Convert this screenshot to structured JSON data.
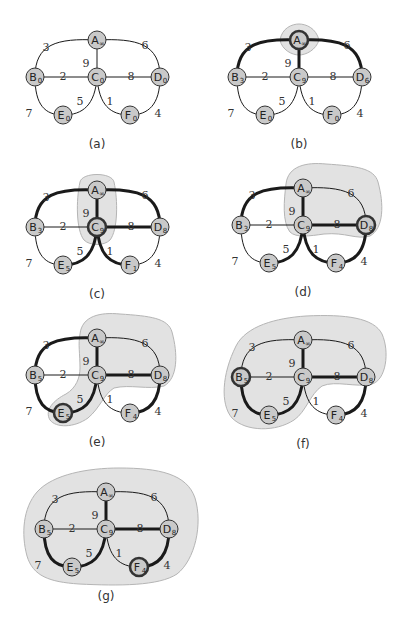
{
  "figure": {
    "node_fill": "#c9c9c9",
    "region_fill": "#e2e2e2",
    "edge_color": "#1a1a1a"
  },
  "graph": {
    "nodes": [
      {
        "id": "A",
        "x": 97,
        "y": 40
      },
      {
        "id": "B",
        "x": 35,
        "y": 77
      },
      {
        "id": "C",
        "x": 97,
        "y": 77
      },
      {
        "id": "D",
        "x": 160,
        "y": 77
      },
      {
        "id": "E",
        "x": 63,
        "y": 115
      },
      {
        "id": "F",
        "x": 130,
        "y": 115
      }
    ],
    "edges": [
      {
        "id": "AB",
        "from": "A",
        "to": "B",
        "weight": "3",
        "label_x": 46,
        "label_y": 47
      },
      {
        "id": "AD",
        "from": "A",
        "to": "D",
        "weight": "6",
        "label_x": 145,
        "label_y": 45
      },
      {
        "id": "AC",
        "from": "A",
        "to": "C",
        "weight": "9",
        "label_x": 86,
        "label_y": 63
      },
      {
        "id": "BC",
        "from": "B",
        "to": "C",
        "weight": "2",
        "label_x": 63,
        "label_y": 76
      },
      {
        "id": "CD",
        "from": "C",
        "to": "D",
        "weight": "8",
        "label_x": 131,
        "label_y": 76
      },
      {
        "id": "CE",
        "from": "C",
        "to": "E",
        "weight": "5",
        "label_x": 80,
        "label_y": 101
      },
      {
        "id": "CF",
        "from": "C",
        "to": "F",
        "weight": "1",
        "label_x": 110,
        "label_y": 101
      },
      {
        "id": "BE",
        "from": "B",
        "to": "E",
        "weight": "7",
        "label_x": 29,
        "label_y": 113
      },
      {
        "id": "DF",
        "from": "D",
        "to": "F",
        "weight": "4",
        "label_x": 158,
        "label_y": 113
      }
    ]
  },
  "panels": [
    {
      "label": "(a)",
      "ox": 0,
      "oy": 0,
      "values": {
        "A": "∞",
        "B": "0",
        "C": "0",
        "D": "0",
        "E": "0",
        "F": "0"
      },
      "thick_edges": [],
      "thick_nodes": [],
      "region": ""
    },
    {
      "label": "(b)",
      "ox": 202,
      "oy": 0,
      "values": {
        "A": "∞",
        "B": "3",
        "C": "9",
        "D": "6",
        "E": "0",
        "F": "0"
      },
      "thick_edges": [
        "AB",
        "AC",
        "AD"
      ],
      "thick_nodes": [
        "A"
      ],
      "region": "M78,40 C80,28 90,24 97,24 C104,24 114,28 117,40 C114,50 104,55 97,55 C90,55 80,50 78,40 Z"
    },
    {
      "label": "(c)",
      "ox": 0,
      "oy": 150,
      "values": {
        "A": "∞",
        "B": "3",
        "C": "9",
        "D": "8",
        "E": "5",
        "F": "1"
      },
      "thick_edges": [
        "AB",
        "AC",
        "AD",
        "CD",
        "CE",
        "CF"
      ],
      "thick_nodes": [
        "C"
      ],
      "region": "M80,32 C82,22 112,22 114,32 C118,50 118,80 110,90 C104,96 90,96 84,90 C76,80 76,50 80,32 Z"
    },
    {
      "label": "(d)",
      "ox": 206,
      "oy": 148,
      "values": {
        "A": "∞",
        "B": "3",
        "C": "9",
        "D": "8",
        "E": "5",
        "F": "4"
      },
      "thick_edges": [
        "AB",
        "AC",
        "CD",
        "CE",
        "CF",
        "DF"
      ],
      "thick_nodes": [
        "D"
      ],
      "region": "M80,36 C82,18 100,14 120,16 C150,18 168,20 172,34 C178,56 178,80 164,88 C150,92 140,84 118,86 C104,88 90,90 84,84 C76,74 78,52 80,36 Z"
    },
    {
      "label": "(e)",
      "ox": 0,
      "oy": 298,
      "values": {
        "A": "∞",
        "B": "5",
        "C": "9",
        "D": "8",
        "E": "5",
        "F": "4"
      },
      "thick_edges": [
        "AB",
        "AC",
        "CD",
        "CE",
        "BE",
        "DF"
      ],
      "thick_nodes": [
        "E"
      ],
      "region": "M80,36 C82,18 100,14 120,16 C150,18 168,20 172,34 C178,56 178,80 164,88 C148,92 130,86 114,90 C104,96 100,110 88,120 C74,130 56,130 50,122 C44,112 54,102 66,96 C76,90 80,80 80,70 C80,56 78,46 80,36 Z"
    },
    {
      "label": "(f)",
      "ox": 206,
      "oy": 300,
      "values": {
        "A": "∞",
        "B": "5",
        "C": "9",
        "D": "8",
        "E": "5",
        "F": "4"
      },
      "thick_edges": [
        "AC",
        "CD",
        "CE",
        "BE",
        "DF"
      ],
      "thick_nodes": [
        "B"
      ],
      "region": "M30,46 C40,26 70,18 100,16 C140,14 168,18 176,34 C184,52 180,80 166,84 C150,88 130,80 116,86 C104,94 100,112 88,120 C70,132 40,132 26,118 C14,104 16,74 30,46 Z"
    },
    {
      "label": "(g)",
      "ox": 9,
      "oy": 452,
      "values": {
        "A": "∞",
        "B": "5",
        "C": "9",
        "D": "8",
        "E": "5",
        "F": "4"
      },
      "thick_edges": [
        "AC",
        "CD",
        "CE",
        "BE",
        "DF"
      ],
      "thick_nodes": [
        "F"
      ],
      "region": "M28,40 C44,22 80,16 110,16 C150,16 178,22 186,46 C194,72 186,108 168,122 C150,134 110,134 70,132 C40,130 24,124 18,104 C12,82 14,56 28,40 Z"
    }
  ]
}
